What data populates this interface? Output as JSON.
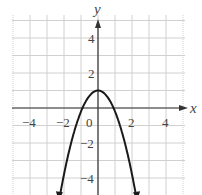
{
  "chart_data": {
    "type": "line",
    "title": "",
    "xlabel": "x",
    "ylabel": "y",
    "xlim": [
      -5,
      5
    ],
    "ylim": [
      -5,
      5.2
    ],
    "grid": true,
    "x_ticks": [
      -4,
      -2,
      0,
      2,
      4
    ],
    "y_ticks": [
      4,
      2,
      -2,
      -4
    ],
    "tick_labels": {
      "x": [
        "−4",
        "−2",
        "0",
        "2",
        "4"
      ],
      "y": [
        "4",
        "2",
        "−2",
        "−4"
      ]
    },
    "series": [
      {
        "name": "parabola",
        "equation": "y = 1 - 1.2x^2 (approx.)",
        "vertex": [
          0,
          1
        ],
        "x_intercepts": [
          -0.9,
          0.9
        ],
        "arrows_at_ends": true,
        "x": [
          -2.3,
          -2.0,
          -1.5,
          -1.0,
          -0.5,
          0,
          0.5,
          1.0,
          1.5,
          2.0,
          2.3
        ],
        "values": [
          -5.3,
          -3.8,
          -1.7,
          -0.2,
          0.7,
          1.0,
          0.7,
          -0.2,
          -1.7,
          -3.8,
          -5.3
        ]
      }
    ],
    "colors": {
      "curve": "#1a1a1a",
      "axes": "#333333",
      "grid": "#d0d0d0",
      "text": "#444444"
    }
  }
}
